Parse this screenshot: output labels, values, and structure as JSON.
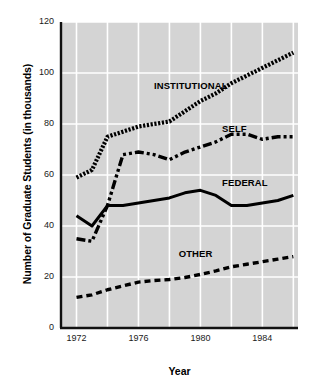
{
  "chart_data": {
    "type": "line",
    "title": "",
    "xlabel": "Year",
    "ylabel": "Number of Graduate Students (in thousands)",
    "xlim": [
      1971.0,
      1986.3
    ],
    "ylim": [
      0,
      120
    ],
    "yticks": [
      0,
      20,
      40,
      60,
      80,
      100,
      120
    ],
    "xticks": [
      1972,
      1976,
      1980,
      1984
    ],
    "ytick_labels": [
      "0",
      "20",
      "40",
      "60",
      "80",
      "100",
      "120"
    ],
    "xtick_labels": [
      "1972",
      "1976",
      "1980",
      "1984"
    ],
    "grid": true,
    "grid_color": "#ffffff",
    "plot_bgcolor": "#d4d4d4",
    "legend_position": "inline-annotations",
    "x": [
      1972,
      1973,
      1974,
      1975,
      1976,
      1977,
      1978,
      1979,
      1980,
      1981,
      1982,
      1983,
      1984,
      1985,
      1986
    ],
    "series": [
      {
        "name": "INSTITUTIONAL",
        "style": "dotted-hatched",
        "color": "#000000",
        "label_x": 1977.0,
        "label_y": 95,
        "values": [
          59,
          62,
          75,
          77,
          79,
          80,
          81,
          85,
          89,
          92,
          96,
          99,
          102,
          105,
          108
        ]
      },
      {
        "name": "SELF",
        "style": "dash-dot-dot",
        "color": "#000000",
        "label_x": 1981.4,
        "label_y": 78,
        "values": [
          35,
          34,
          48,
          68,
          69,
          68,
          66,
          69,
          71,
          73,
          76,
          76,
          74,
          75,
          75
        ]
      },
      {
        "name": "FEDERAL",
        "style": "solid",
        "color": "#000000",
        "label_x": 1981.4,
        "label_y": 57,
        "values": [
          44,
          40,
          48,
          48,
          49,
          50,
          51,
          53,
          54,
          52,
          48,
          48,
          49,
          50,
          52
        ]
      },
      {
        "name": "OTHER",
        "style": "dashed",
        "color": "#000000",
        "label_x": 1978.6,
        "label_y": 29,
        "values": [
          12,
          13,
          15,
          16.5,
          18,
          18.6,
          19,
          19.8,
          21,
          22.4,
          24,
          25,
          26,
          27,
          28
        ]
      }
    ]
  },
  "axes": {
    "y_title": "Number of Graduate Students (in thousands)",
    "x_title": "Year"
  }
}
